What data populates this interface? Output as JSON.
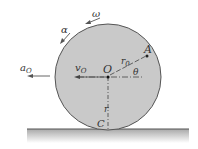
{
  "diagram": {
    "labels": {
      "omega": "ω",
      "alpha": "α",
      "a_O": "a",
      "a_O_sub": "O",
      "v_O": "v",
      "v_O_sub": "O",
      "center": "O",
      "point_A": "A",
      "r0": "r",
      "r0_sub": "0",
      "theta": "θ",
      "r": "r",
      "contact": "C"
    },
    "colors": {
      "wheel_fill": "#c9c9c9",
      "wheel_stroke": "#555555",
      "ground_top": "#666666",
      "ground_shade": "#bdbdbd",
      "text": "#333333"
    }
  }
}
